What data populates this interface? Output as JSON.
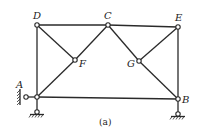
{
  "figure": {
    "caption": "(a)",
    "nodes": [
      {
        "id": "D",
        "label": "D",
        "x": 37,
        "y": 25
      },
      {
        "id": "C",
        "label": "C",
        "x": 108,
        "y": 25
      },
      {
        "id": "E",
        "label": "E",
        "x": 178,
        "y": 27
      },
      {
        "id": "F",
        "label": "F",
        "x": 75,
        "y": 60
      },
      {
        "id": "G",
        "label": "G",
        "x": 139,
        "y": 61
      },
      {
        "id": "A",
        "label": "A",
        "x": 37,
        "y": 97
      },
      {
        "id": "B",
        "label": "B",
        "x": 178,
        "y": 99
      }
    ],
    "members": [
      [
        "D",
        "C"
      ],
      [
        "C",
        "E"
      ],
      [
        "D",
        "A"
      ],
      [
        "E",
        "B"
      ],
      [
        "A",
        "B"
      ],
      [
        "D",
        "F"
      ],
      [
        "F",
        "C"
      ],
      [
        "A",
        "F"
      ],
      [
        "C",
        "G"
      ],
      [
        "G",
        "B"
      ],
      [
        "G",
        "E"
      ]
    ],
    "supports": [
      {
        "node": "A",
        "type": "pin-wall-left"
      },
      {
        "node": "A",
        "type": "pin-ground"
      },
      {
        "node": "B",
        "type": "pin-ground"
      }
    ]
  }
}
